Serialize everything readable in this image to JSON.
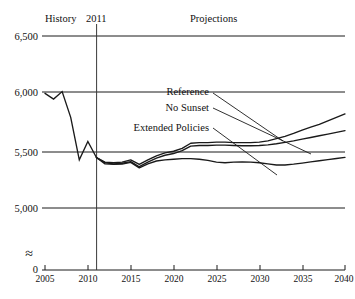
{
  "chart_data": {
    "type": "line",
    "title": "",
    "xlabel": "",
    "ylabel": "",
    "xlim": [
      2005,
      2040
    ],
    "ylim": [
      4850,
      6500
    ],
    "yticks": [
      0,
      5000,
      5500,
      6000,
      6500
    ],
    "ytick_labels": [
      "0",
      "5,000",
      "5,500",
      "6,000",
      "6,500"
    ],
    "xticks": [
      2005,
      2010,
      2015,
      2020,
      2025,
      2030,
      2035,
      2040
    ],
    "xtick_labels": [
      "2005",
      "2010",
      "2015",
      "2020",
      "2025",
      "2030",
      "2035",
      "2040"
    ],
    "grid": "horizontal",
    "axis_break": true,
    "axis_break_symbol": "≈",
    "legend_position": "inline-labels-with-leaders",
    "annotations": {
      "history_label": "History",
      "divider_year_label": "2011",
      "projections_label": "Projections",
      "divider_year": 2011
    },
    "series": [
      {
        "name": "History",
        "x": [
          2005,
          2006,
          2007,
          2008,
          2009,
          2010,
          2011
        ],
        "values": [
          6000,
          5950,
          6015,
          5790,
          5420,
          5580,
          5440
        ]
      },
      {
        "name": "Reference",
        "x": [
          2011,
          2012,
          2013,
          2014,
          2015,
          2016,
          2017,
          2018,
          2019,
          2020,
          2021,
          2022,
          2023,
          2024,
          2025,
          2026,
          2027,
          2028,
          2029,
          2030,
          2031,
          2032,
          2033,
          2034,
          2035,
          2036,
          2037,
          2038,
          2039,
          2040
        ],
        "values": [
          5440,
          5400,
          5395,
          5400,
          5420,
          5380,
          5420,
          5455,
          5480,
          5495,
          5520,
          5565,
          5570,
          5570,
          5575,
          5575,
          5570,
          5570,
          5570,
          5575,
          5585,
          5605,
          5625,
          5650,
          5680,
          5705,
          5730,
          5760,
          5790,
          5820
        ]
      },
      {
        "name": "No Sunset",
        "x": [
          2011,
          2012,
          2013,
          2014,
          2015,
          2016,
          2017,
          2018,
          2019,
          2020,
          2021,
          2022,
          2023,
          2024,
          2025,
          2026,
          2027,
          2028,
          2029,
          2030,
          2031,
          2032,
          2033,
          2034,
          2035,
          2036,
          2037,
          2038,
          2039,
          2040
        ],
        "values": [
          5440,
          5395,
          5385,
          5390,
          5405,
          5360,
          5400,
          5435,
          5460,
          5475,
          5500,
          5540,
          5545,
          5545,
          5548,
          5548,
          5545,
          5543,
          5543,
          5545,
          5550,
          5560,
          5572,
          5585,
          5600,
          5615,
          5630,
          5645,
          5660,
          5675
        ]
      },
      {
        "name": "Extended Policies",
        "x": [
          2011,
          2012,
          2013,
          2014,
          2015,
          2016,
          2017,
          2018,
          2019,
          2020,
          2021,
          2022,
          2023,
          2024,
          2025,
          2026,
          2027,
          2028,
          2029,
          2030,
          2031,
          2032,
          2033,
          2034,
          2035,
          2036,
          2037,
          2038,
          2039,
          2040
        ],
        "values": [
          5440,
          5385,
          5380,
          5382,
          5398,
          5350,
          5385,
          5410,
          5420,
          5425,
          5430,
          5430,
          5425,
          5415,
          5400,
          5395,
          5400,
          5402,
          5400,
          5395,
          5385,
          5375,
          5375,
          5382,
          5392,
          5402,
          5412,
          5422,
          5432,
          5442
        ]
      }
    ],
    "series_labels": [
      {
        "name": "Reference",
        "text": "Reference"
      },
      {
        "name": "No Sunset",
        "text": "No Sunset"
      },
      {
        "name": "Extended Policies",
        "text": "Extended Policies"
      }
    ]
  },
  "colors": {
    "line": "#1a1a1a",
    "grid": "#1a1a1a",
    "background": "#ffffff"
  }
}
